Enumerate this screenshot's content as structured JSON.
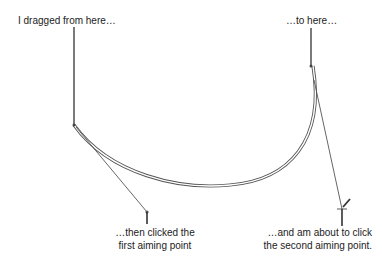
{
  "diagram": {
    "annotations": {
      "start": "I dragged from here…",
      "end": "…to here…",
      "first_aim_line1": "…then clicked the",
      "first_aim_line2": "first aiming point",
      "second_aim_line1": "…and am about to click",
      "second_aim_line2": "the second aiming point."
    },
    "points": {
      "drag_start": [
        74,
        125
      ],
      "drag_end": [
        311,
        65
      ],
      "first_aiming_point": [
        147,
        212
      ],
      "second_aiming_point": [
        342,
        209
      ]
    },
    "colors": {
      "stroke": "#333333",
      "curve": "#555555",
      "text": "#222222",
      "background": "#ffffff"
    }
  }
}
